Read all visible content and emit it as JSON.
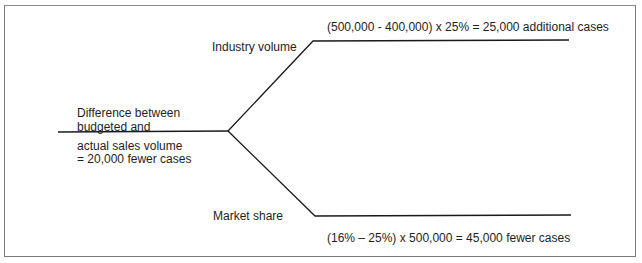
{
  "diagram": {
    "type": "variance-decomposition-tree",
    "root": {
      "label_line1": "Difference between",
      "label_line2": "budgeted and",
      "label_line3": "actual sales volume",
      "label_line4": "= 20,000 fewer cases"
    },
    "branches": [
      {
        "name": "Industry volume",
        "calculation": "(500,000 - 400,000) x 25% = 25,000 additional cases"
      },
      {
        "name": "Market share",
        "calculation": "(16% – 25%) x 500,000 = 45,000 fewer cases"
      }
    ],
    "colors": {
      "line": "#1a1a1a",
      "frame": "#7a7a7a",
      "background": "#ffffff"
    }
  }
}
